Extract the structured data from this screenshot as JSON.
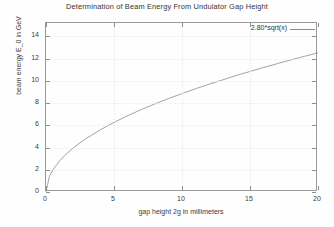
{
  "chart_data": {
    "type": "line",
    "title": "Determination of Beam Energy From Undulator Gap Height",
    "xlabel": "gap height 2g in millimeters",
    "ylabel": "beam energy E_0 in GeV",
    "xlim": [
      0,
      20
    ],
    "ylim": [
      0,
      15.2
    ],
    "grid": true,
    "legend_position": "top-right",
    "xticks": [
      "0",
      "5",
      "10",
      "15",
      "20"
    ],
    "xtick_values": [
      0,
      5,
      10,
      15,
      20
    ],
    "yticks": [
      "0",
      "2",
      "4",
      "6",
      "8",
      "10",
      "12",
      "14"
    ],
    "ytick_values": [
      0,
      2,
      4,
      6,
      8,
      10,
      12,
      14
    ],
    "series": [
      {
        "name": "2.80*sqrt(x)",
        "color": "#8c8c8c",
        "x": [
          0,
          0.25,
          0.5,
          1,
          1.5,
          2,
          2.5,
          3,
          4,
          5,
          6,
          7,
          8,
          9,
          10,
          11,
          12,
          13,
          14,
          15,
          16,
          17,
          18,
          19,
          20
        ],
        "values": [
          0,
          1.4,
          1.98,
          2.8,
          3.43,
          3.96,
          4.43,
          4.85,
          5.6,
          6.26,
          6.86,
          7.41,
          7.92,
          8.4,
          8.85,
          9.29,
          9.7,
          10.09,
          10.48,
          10.84,
          11.2,
          11.54,
          11.88,
          12.2,
          12.52
        ]
      }
    ]
  },
  "legend": {
    "entry_label": "2.80*sqrt(x)"
  }
}
